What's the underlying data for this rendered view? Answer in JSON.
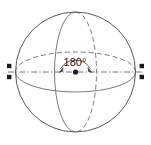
{
  "figure": {
    "background_color": "#ffffff",
    "stroke_color": "#5a5a5a",
    "label_color": "#1a1a1a",
    "width": 151,
    "height": 145
  },
  "sphere": {
    "name": "sphere-outline",
    "center_x": 75.5,
    "center_y": 72,
    "radius": 60
  },
  "equator": {
    "name": "equator-ellipse",
    "rx": 60,
    "ry": 20,
    "front_style": "solid",
    "back_style": "dashed"
  },
  "meridian": {
    "name": "meridian-ellipse",
    "rx": 21,
    "ry": 60,
    "front_style": "solid",
    "back_style": "dashed"
  },
  "axis": {
    "name": "polar-axis-line",
    "style": "dash-dot",
    "x_start": 8,
    "x_end": 143,
    "y": 72
  },
  "center_point": {
    "name": "sphere-center-point",
    "x": 75.5,
    "y": 72,
    "radius": 2.6
  },
  "pole_markers": {
    "left": [
      {
        "x": 9,
        "y": 66
      },
      {
        "x": 9,
        "y": 77
      }
    ],
    "right": [
      {
        "x": 142,
        "y": 66
      },
      {
        "x": 142,
        "y": 77
      }
    ],
    "radius": 2.2
  },
  "angle_annotation": {
    "name": "angle-180-arc",
    "label": "180°",
    "label_x": 75,
    "label_y": 65,
    "arc_radius": 17,
    "arrow_left_x": 59,
    "arrow_left_y": 72,
    "arrow_right_x": 92,
    "arrow_right_y": 72
  }
}
